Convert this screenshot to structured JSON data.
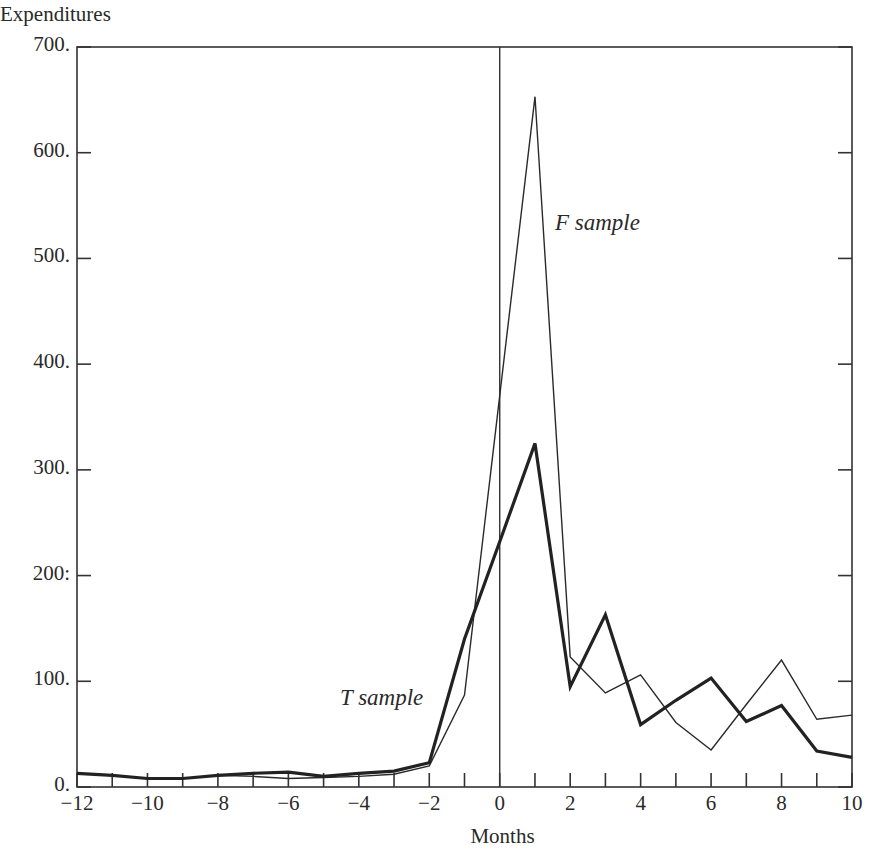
{
  "chart_data": {
    "type": "line",
    "title": "",
    "xlabel": "Months",
    "ylabel": "Expenditures",
    "xlim": [
      -12,
      10
    ],
    "ylim": [
      0,
      700
    ],
    "grid": false,
    "legend": "inline labels",
    "x": [
      -12,
      -11,
      -10,
      -9,
      -8,
      -7,
      -6,
      -5,
      -4,
      -3,
      -2,
      -1,
      0,
      1,
      2,
      3,
      4,
      5,
      6,
      7,
      8,
      9,
      10
    ],
    "series": [
      {
        "name": "T sample",
        "style": "thick",
        "values": [
          13,
          11,
          8,
          8,
          11,
          13,
          14,
          10,
          13,
          15,
          23,
          140,
          232,
          325,
          95,
          163,
          59,
          82,
          103,
          62,
          77,
          34,
          28
        ]
      },
      {
        "name": "F sample",
        "style": "thin",
        "values": [
          13,
          11,
          8,
          8,
          11,
          10,
          8,
          9,
          10,
          12,
          20,
          87,
          370,
          653,
          123,
          89,
          106,
          61,
          35,
          78,
          120,
          64,
          68
        ]
      }
    ],
    "annotations": [
      {
        "text": "F sample",
        "near": {
          "x": 1.6,
          "y": 525
        }
      },
      {
        "text": "T sample",
        "near": {
          "x": -4.6,
          "y": 95
        }
      },
      {
        "type": "vertical-line",
        "x": 0
      }
    ],
    "xticks": [
      -12,
      -11,
      -10,
      -9,
      -8,
      -7,
      -6,
      -5,
      -4,
      -3,
      -2,
      -1,
      0,
      1,
      2,
      3,
      4,
      5,
      6,
      7,
      8,
      9,
      10
    ],
    "xtick_labels": [
      "−12",
      "−10",
      "−8",
      "−6",
      "−4",
      "−2",
      "0",
      "2",
      "4",
      "6",
      "8",
      "10"
    ],
    "yticks": [
      0,
      100,
      200,
      300,
      400,
      500,
      600,
      700
    ],
    "ytick_labels": [
      "0.",
      "100.",
      "200:",
      "300.",
      "400.",
      "500.",
      "600.",
      "700."
    ]
  },
  "labels": {
    "y_title": "Expenditures",
    "x_title": "Months",
    "f_sample": "F sample",
    "t_sample": "T sample"
  }
}
